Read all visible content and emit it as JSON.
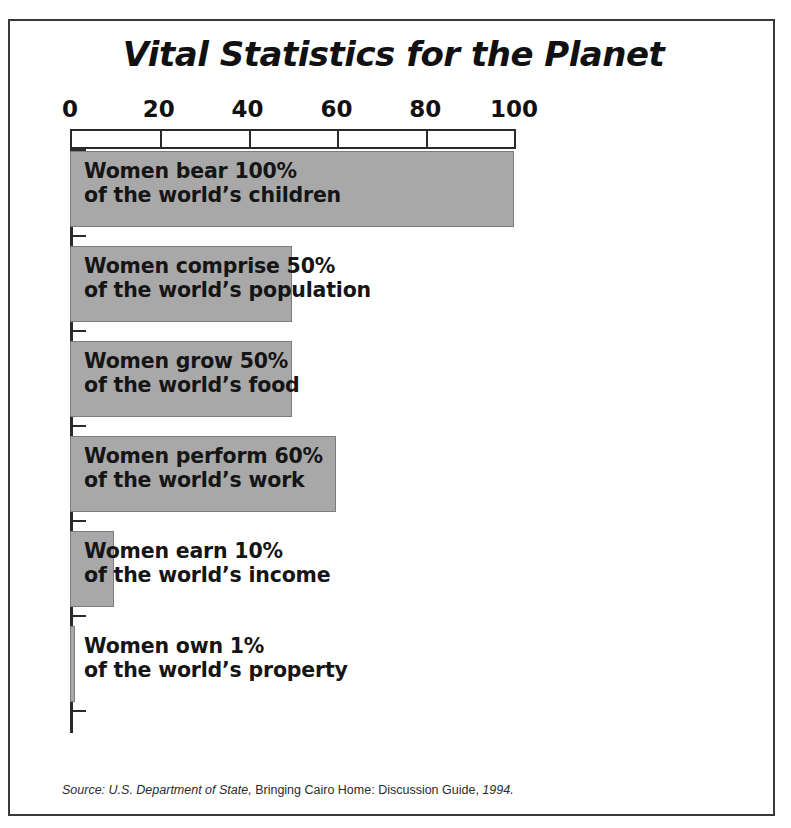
{
  "figure": {
    "title": "Vital Statistics for the Planet",
    "source_prefix": "Source: U.S. Department of State,",
    "source_middle": " Bringing Cairo Home: Discussion Guide, ",
    "source_year": "1994.",
    "bar_color": "#a8a8a8",
    "bar_border_color": "#7d7d7d",
    "axis_color": "#2a2a2a",
    "frame_color": "#3a3a3a",
    "background": "#ffffff"
  },
  "axis": {
    "ticks": [
      {
        "label": "0",
        "value": 0
      },
      {
        "label": "20",
        "value": 20
      },
      {
        "label": "40",
        "value": 40
      },
      {
        "label": "60",
        "value": 60
      },
      {
        "label": "80",
        "value": 80
      },
      {
        "label": "100",
        "value": 100
      }
    ]
  },
  "chart_data": {
    "type": "bar",
    "orientation": "horizontal",
    "title": "Vital Statistics for the Planet",
    "xlabel": "",
    "ylabel": "",
    "xlim": [
      0,
      100
    ],
    "grid": false,
    "legend": false,
    "xticks": [
      0,
      20,
      40,
      60,
      80,
      100
    ],
    "categories": [
      "Women bear 100% of the world's children",
      "Women comprise 50% of the world's population",
      "Women grow 50% of the world's food",
      "Women perform 60% of the world's work",
      "Women earn 10% of the world's income",
      "Women own 1% of the world's property"
    ],
    "values": [
      100,
      50,
      50,
      60,
      10,
      1
    ],
    "bars": [
      {
        "value": 100,
        "line1": "Women bear 100%",
        "line2": "of the world’s children"
      },
      {
        "value": 50,
        "line1": "Women comprise 50%",
        "line2": "of the world’s population"
      },
      {
        "value": 50,
        "line1": "Women grow 50%",
        "line2": "of the world’s food"
      },
      {
        "value": 60,
        "line1": "Women perform 60%",
        "line2": "of the world’s work"
      },
      {
        "value": 10,
        "line1": "Women earn 10%",
        "line2": "of the world’s income"
      },
      {
        "value": 1,
        "line1": "Women own 1%",
        "line2": "of the world’s property"
      }
    ],
    "source": "Source: U.S. Department of State, Bringing Cairo Home: Discussion Guide, 1994."
  }
}
